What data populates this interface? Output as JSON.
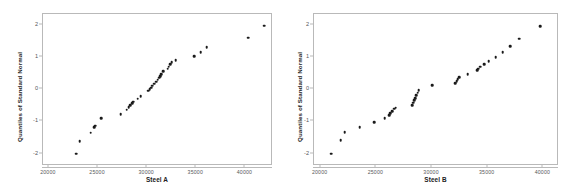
{
  "chart_data": [
    {
      "type": "scatter",
      "panel": "left",
      "title": "",
      "xlabel": "Steel A",
      "ylabel": "Quantiles of Standard Normal",
      "xlim": [
        19400,
        42800
      ],
      "ylim": [
        -2.38,
        2.33
      ],
      "xticks": [
        20000,
        25000,
        30000,
        35000,
        40000
      ],
      "xticklabels": [
        "20000",
        "25000",
        "30000",
        "35000",
        "40000"
      ],
      "yticks": [
        2,
        1,
        0,
        -1,
        -2
      ],
      "yticklabels": [
        "2",
        "1",
        "0",
        "-1",
        "-2"
      ],
      "grid": false,
      "legend": null,
      "marker": "filled-circle",
      "marker_color": "#1a1a1a",
      "points": [
        {
          "x": 22800,
          "y": -2.0
        },
        {
          "x": 23150,
          "y": -1.61
        },
        {
          "x": 24250,
          "y": -1.35
        },
        {
          "x": 24600,
          "y": -1.18
        },
        {
          "x": 24700,
          "y": -1.13
        },
        {
          "x": 25300,
          "y": -0.89
        },
        {
          "x": 27300,
          "y": -0.78
        },
        {
          "x": 27900,
          "y": -0.63
        },
        {
          "x": 28100,
          "y": -0.56
        },
        {
          "x": 28250,
          "y": -0.5
        },
        {
          "x": 28450,
          "y": -0.44
        },
        {
          "x": 28600,
          "y": -0.39
        },
        {
          "x": 29050,
          "y": -0.29
        },
        {
          "x": 29350,
          "y": -0.21
        },
        {
          "x": 30100,
          "y": -0.05
        },
        {
          "x": 30250,
          "y": 0.0
        },
        {
          "x": 30400,
          "y": 0.05
        },
        {
          "x": 30500,
          "y": 0.11
        },
        {
          "x": 30700,
          "y": 0.17
        },
        {
          "x": 30900,
          "y": 0.23
        },
        {
          "x": 31050,
          "y": 0.29
        },
        {
          "x": 31200,
          "y": 0.35
        },
        {
          "x": 31300,
          "y": 0.41
        },
        {
          "x": 31450,
          "y": 0.47
        },
        {
          "x": 31600,
          "y": 0.55
        },
        {
          "x": 32100,
          "y": 0.63
        },
        {
          "x": 32200,
          "y": 0.7
        },
        {
          "x": 32350,
          "y": 0.77
        },
        {
          "x": 32500,
          "y": 0.84
        },
        {
          "x": 32900,
          "y": 0.9
        },
        {
          "x": 34800,
          "y": 1.03
        },
        {
          "x": 35450,
          "y": 1.14
        },
        {
          "x": 36050,
          "y": 1.31
        },
        {
          "x": 40300,
          "y": 1.59
        },
        {
          "x": 41900,
          "y": 1.97
        }
      ]
    },
    {
      "type": "scatter",
      "panel": "right",
      "title": "",
      "xlabel": "Steel B",
      "ylabel": "Quantiles of Standard Normal",
      "xlim": [
        19400,
        41400
      ],
      "ylim": [
        -2.38,
        2.33
      ],
      "xticks": [
        20000,
        25000,
        30000,
        35000,
        40000
      ],
      "xticklabels": [
        "20000",
        "25000",
        "30000",
        "35000",
        "40000"
      ],
      "yticks": [
        2,
        1,
        0,
        -1,
        -2
      ],
      "yticklabels": [
        "2",
        "1",
        "0",
        "-1",
        "-2"
      ],
      "grid": false,
      "legend": null,
      "marker": "filled-circle",
      "marker_color": "#1a1a1a",
      "points": [
        {
          "x": 20950,
          "y": -2.0
        },
        {
          "x": 21800,
          "y": -1.58
        },
        {
          "x": 22150,
          "y": -1.33
        },
        {
          "x": 23500,
          "y": -1.17
        },
        {
          "x": 24800,
          "y": -1.02
        },
        {
          "x": 25750,
          "y": -0.9
        },
        {
          "x": 26150,
          "y": -0.8
        },
        {
          "x": 26250,
          "y": -0.75
        },
        {
          "x": 26400,
          "y": -0.69
        },
        {
          "x": 26600,
          "y": -0.6
        },
        {
          "x": 26750,
          "y": -0.57
        },
        {
          "x": 28200,
          "y": -0.5
        },
        {
          "x": 28300,
          "y": -0.42
        },
        {
          "x": 28400,
          "y": -0.34
        },
        {
          "x": 28500,
          "y": -0.27
        },
        {
          "x": 28600,
          "y": -0.19
        },
        {
          "x": 28700,
          "y": -0.11
        },
        {
          "x": 28800,
          "y": -0.03
        },
        {
          "x": 30000,
          "y": 0.12
        },
        {
          "x": 32100,
          "y": 0.19
        },
        {
          "x": 32200,
          "y": 0.25
        },
        {
          "x": 32300,
          "y": 0.31
        },
        {
          "x": 32450,
          "y": 0.38
        },
        {
          "x": 33200,
          "y": 0.47
        },
        {
          "x": 34050,
          "y": 0.58
        },
        {
          "x": 34150,
          "y": 0.63
        },
        {
          "x": 34300,
          "y": 0.7
        },
        {
          "x": 34700,
          "y": 0.78
        },
        {
          "x": 35100,
          "y": 0.87
        },
        {
          "x": 35700,
          "y": 0.99
        },
        {
          "x": 36350,
          "y": 1.14
        },
        {
          "x": 37000,
          "y": 1.33
        },
        {
          "x": 37850,
          "y": 1.57
        },
        {
          "x": 39700,
          "y": 1.96
        }
      ]
    }
  ]
}
